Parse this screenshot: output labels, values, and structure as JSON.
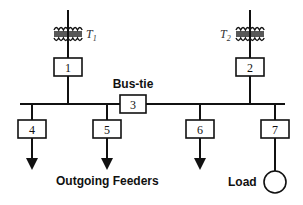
{
  "diagram": {
    "transformers": [
      {
        "name": "T",
        "sub": "1"
      },
      {
        "name": "T",
        "sub": "2"
      }
    ],
    "breakers": [
      "1",
      "2",
      "3",
      "4",
      "5",
      "6",
      "7"
    ],
    "bus_tie_label": "Bus-tie",
    "feeders_label": "Outgoing Feeders",
    "load_label": "Load",
    "line_color": "#111111"
  }
}
